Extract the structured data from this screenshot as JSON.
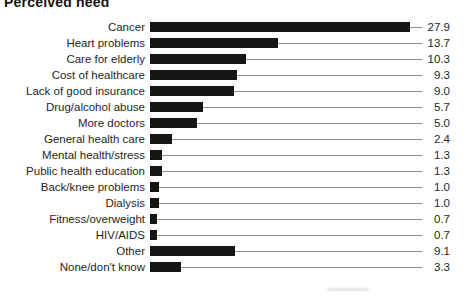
{
  "title": "Perceived need",
  "chart_data": {
    "type": "bar",
    "orientation": "horizontal",
    "title": "Perceived need",
    "categories": [
      "Cancer",
      "Heart problems",
      "Care for elderly",
      "Cost of healthcare",
      "Lack of good insurance",
      "Drug/alcohol abuse",
      "More doctors",
      "General health care",
      "Mental health/stress",
      "Public health education",
      "Back/knee problems",
      "Dialysis",
      "Fitness/overweight",
      "HIV/AIDS",
      "Other",
      "None/don't know"
    ],
    "values": [
      27.9,
      13.7,
      10.3,
      9.3,
      9.0,
      5.7,
      5.0,
      2.4,
      1.3,
      1.3,
      1.0,
      1.0,
      0.7,
      0.7,
      9.1,
      3.3
    ],
    "value_labels": [
      "27.9",
      "13.7",
      "10.3",
      "9.3",
      "9.0",
      "5.7",
      "5.0",
      "2.4",
      "1.3",
      "1.3",
      "1.0",
      "1.0",
      "0.7",
      "0.7",
      "9.1",
      "3.3"
    ],
    "xlim": [
      0,
      27.9
    ],
    "grid": "off",
    "legend": "none",
    "bar_color": "#151515",
    "leader_line_color": "#8f8f8f",
    "text_color": "#1f1f1f"
  }
}
